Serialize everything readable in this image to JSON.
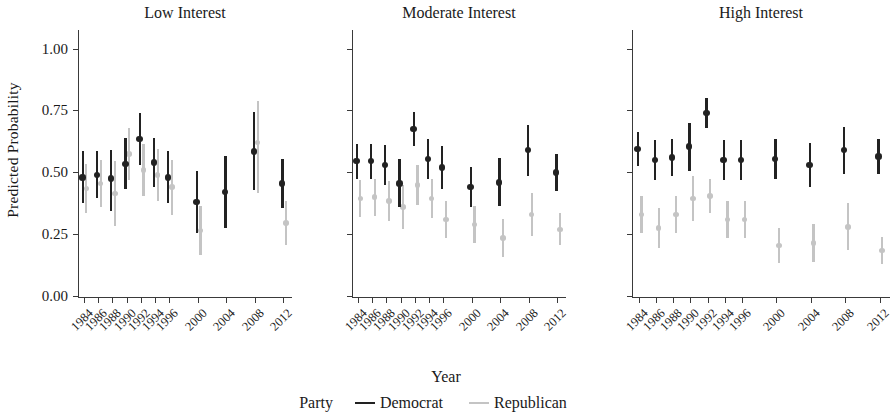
{
  "figure": {
    "ylabel": "Predicted Probability",
    "xlabel": "Year",
    "legend_title": "Party"
  },
  "chart_data": {
    "type": "scatter",
    "title": "",
    "xlabel": "Year",
    "ylabel": "Predicted Probability",
    "ylim": [
      0.0,
      1.0
    ],
    "yticks": [
      "0.00",
      "0.25",
      "0.50",
      "0.75",
      "1.00"
    ],
    "ytick_values": [
      0.0,
      0.25,
      0.5,
      0.75,
      1.0
    ],
    "grid": false,
    "legend_position": "bottom",
    "legend": [
      "Democrat",
      "Republican"
    ],
    "colors": {
      "democrat": "#222222",
      "republican": "#c4c4c4",
      "axis": "#3a3a3a",
      "text": "#1a1a1a"
    },
    "categories": [
      "1984",
      "1986",
      "1988",
      "1990",
      "1992",
      "1994",
      "1996",
      "2000",
      "2004",
      "2008",
      "2012"
    ],
    "panels": [
      {
        "label": "Low Interest",
        "series": [
          {
            "name": "Democrat",
            "color": "#222222",
            "points": [
              {
                "x": "1984",
                "y": 0.48,
                "lo": 0.375,
                "hi": 0.585
              },
              {
                "x": "1986",
                "y": 0.49,
                "lo": 0.395,
                "hi": 0.585
              },
              {
                "x": "1988",
                "y": 0.475,
                "lo": 0.345,
                "hi": 0.59
              },
              {
                "x": "1990",
                "y": 0.535,
                "lo": 0.435,
                "hi": 0.64
              },
              {
                "x": "1992",
                "y": 0.635,
                "lo": 0.53,
                "hi": 0.74
              },
              {
                "x": "1994",
                "y": 0.54,
                "lo": 0.44,
                "hi": 0.64
              },
              {
                "x": "1996",
                "y": 0.48,
                "lo": 0.375,
                "hi": 0.585
              },
              {
                "x": "2000",
                "y": 0.38,
                "lo": 0.255,
                "hi": 0.505
              },
              {
                "x": "2004",
                "y": 0.42,
                "lo": 0.275,
                "hi": 0.565
              },
              {
                "x": "2008",
                "y": 0.585,
                "lo": 0.43,
                "hi": 0.745
              },
              {
                "x": "2012",
                "y": 0.455,
                "lo": 0.355,
                "hi": 0.555
              }
            ]
          },
          {
            "name": "Republican",
            "color": "#c4c4c4",
            "points": [
              {
                "x": "1984",
                "y": 0.435,
                "lo": 0.335,
                "hi": 0.535
              },
              {
                "x": "1986",
                "y": 0.455,
                "lo": 0.36,
                "hi": 0.55
              },
              {
                "x": "1988",
                "y": 0.415,
                "lo": 0.285,
                "hi": 0.545
              },
              {
                "x": "1990",
                "y": 0.575,
                "lo": 0.47,
                "hi": 0.68
              },
              {
                "x": "1992",
                "y": 0.51,
                "lo": 0.405,
                "hi": 0.615
              },
              {
                "x": "1994",
                "y": 0.49,
                "lo": 0.385,
                "hi": 0.595
              },
              {
                "x": "1996",
                "y": 0.44,
                "lo": 0.33,
                "hi": 0.55
              },
              {
                "x": "2000",
                "y": 0.265,
                "lo": 0.165,
                "hi": 0.365
              },
              {
                "x": "2004",
                "y": 0.0,
                "lo": 0.0,
                "hi": 0.0
              },
              {
                "x": "2008",
                "y": 0.62,
                "lo": 0.415,
                "hi": 0.79
              },
              {
                "x": "2012",
                "y": 0.295,
                "lo": 0.205,
                "hi": 0.385
              }
            ]
          }
        ]
      },
      {
        "label": "Moderate Interest",
        "series": [
          {
            "name": "Democrat",
            "color": "#222222",
            "points": [
              {
                "x": "1984",
                "y": 0.545,
                "lo": 0.475,
                "hi": 0.615
              },
              {
                "x": "1986",
                "y": 0.545,
                "lo": 0.475,
                "hi": 0.615
              },
              {
                "x": "1988",
                "y": 0.53,
                "lo": 0.45,
                "hi": 0.61
              },
              {
                "x": "1990",
                "y": 0.455,
                "lo": 0.36,
                "hi": 0.555
              },
              {
                "x": "1992",
                "y": 0.675,
                "lo": 0.605,
                "hi": 0.745
              },
              {
                "x": "1994",
                "y": 0.555,
                "lo": 0.475,
                "hi": 0.635
              },
              {
                "x": "1996",
                "y": 0.52,
                "lo": 0.435,
                "hi": 0.605
              },
              {
                "x": "2000",
                "y": 0.44,
                "lo": 0.36,
                "hi": 0.52
              },
              {
                "x": "2004",
                "y": 0.46,
                "lo": 0.365,
                "hi": 0.56
              },
              {
                "x": "2008",
                "y": 0.59,
                "lo": 0.485,
                "hi": 0.69
              },
              {
                "x": "2012",
                "y": 0.5,
                "lo": 0.425,
                "hi": 0.575
              }
            ]
          },
          {
            "name": "Republican",
            "color": "#c4c4c4",
            "points": [
              {
                "x": "1984",
                "y": 0.395,
                "lo": 0.32,
                "hi": 0.47
              },
              {
                "x": "1986",
                "y": 0.4,
                "lo": 0.325,
                "hi": 0.475
              },
              {
                "x": "1988",
                "y": 0.385,
                "lo": 0.305,
                "hi": 0.465
              },
              {
                "x": "1990",
                "y": 0.36,
                "lo": 0.27,
                "hi": 0.45
              },
              {
                "x": "1992",
                "y": 0.45,
                "lo": 0.37,
                "hi": 0.53
              },
              {
                "x": "1994",
                "y": 0.395,
                "lo": 0.315,
                "hi": 0.475
              },
              {
                "x": "1996",
                "y": 0.31,
                "lo": 0.235,
                "hi": 0.385
              },
              {
                "x": "2000",
                "y": 0.29,
                "lo": 0.215,
                "hi": 0.365
              },
              {
                "x": "2004",
                "y": 0.235,
                "lo": 0.16,
                "hi": 0.31
              },
              {
                "x": "2008",
                "y": 0.33,
                "lo": 0.245,
                "hi": 0.415
              },
              {
                "x": "2012",
                "y": 0.27,
                "lo": 0.205,
                "hi": 0.335
              }
            ]
          }
        ]
      },
      {
        "label": "High Interest",
        "series": [
          {
            "name": "Democrat",
            "color": "#222222",
            "points": [
              {
                "x": "1984",
                "y": 0.595,
                "lo": 0.525,
                "hi": 0.665
              },
              {
                "x": "1986",
                "y": 0.55,
                "lo": 0.47,
                "hi": 0.63
              },
              {
                "x": "1988",
                "y": 0.56,
                "lo": 0.485,
                "hi": 0.635
              },
              {
                "x": "1990",
                "y": 0.605,
                "lo": 0.505,
                "hi": 0.7
              },
              {
                "x": "1992",
                "y": 0.74,
                "lo": 0.68,
                "hi": 0.8
              },
              {
                "x": "1994",
                "y": 0.55,
                "lo": 0.47,
                "hi": 0.63
              },
              {
                "x": "1996",
                "y": 0.55,
                "lo": 0.47,
                "hi": 0.63
              },
              {
                "x": "2000",
                "y": 0.555,
                "lo": 0.475,
                "hi": 0.635
              },
              {
                "x": "2004",
                "y": 0.53,
                "lo": 0.44,
                "hi": 0.62
              },
              {
                "x": "2008",
                "y": 0.59,
                "lo": 0.495,
                "hi": 0.685
              },
              {
                "x": "2012",
                "y": 0.565,
                "lo": 0.495,
                "hi": 0.635
              }
            ]
          },
          {
            "name": "Republican",
            "color": "#c4c4c4",
            "points": [
              {
                "x": "1984",
                "y": 0.33,
                "lo": 0.255,
                "hi": 0.405
              },
              {
                "x": "1986",
                "y": 0.275,
                "lo": 0.195,
                "hi": 0.355
              },
              {
                "x": "1988",
                "y": 0.33,
                "lo": 0.255,
                "hi": 0.405
              },
              {
                "x": "1990",
                "y": 0.395,
                "lo": 0.305,
                "hi": 0.485
              },
              {
                "x": "1992",
                "y": 0.405,
                "lo": 0.335,
                "hi": 0.475
              },
              {
                "x": "1994",
                "y": 0.31,
                "lo": 0.235,
                "hi": 0.385
              },
              {
                "x": "1996",
                "y": 0.31,
                "lo": 0.235,
                "hi": 0.385
              },
              {
                "x": "2000",
                "y": 0.205,
                "lo": 0.135,
                "hi": 0.275
              },
              {
                "x": "2004",
                "y": 0.215,
                "lo": 0.14,
                "hi": 0.29
              },
              {
                "x": "2008",
                "y": 0.28,
                "lo": 0.185,
                "hi": 0.375
              },
              {
                "x": "2012",
                "y": 0.185,
                "lo": 0.13,
                "hi": 0.24
              }
            ]
          }
        ]
      }
    ]
  }
}
